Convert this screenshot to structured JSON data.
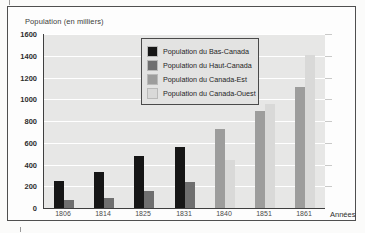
{
  "figure": {
    "title": "Population (en milliers)",
    "x_axis_title": "Années"
  },
  "colors": {
    "plot_background": "#e7e7e6",
    "gridline": "#ffffff",
    "figure_border": "#4f4f4f",
    "bas_canada": "#161616",
    "haut_canada": "#6f6f6f",
    "canada_est": "#9d9d9c",
    "canada_ouest": "#d9d9d8"
  },
  "chart_data": {
    "type": "bar",
    "title": "Population (en milliers)",
    "xlabel": "Années",
    "ylabel": "Population (en milliers)",
    "ylim": [
      0,
      1600
    ],
    "ytick_step": 200,
    "yticks": [
      0,
      200,
      400,
      600,
      800,
      1000,
      1200,
      1400,
      1600
    ],
    "grid": true,
    "legend_position": "top-center-inside",
    "categories": [
      "1806",
      "1814",
      "1825",
      "1831",
      "1840",
      "1851",
      "1861"
    ],
    "series": [
      {
        "name": "Population du Bas-Canada",
        "color": "#161616",
        "values": [
          250,
          335,
          480,
          560,
          null,
          null,
          null
        ]
      },
      {
        "name": "Population du Haut-Canada",
        "color": "#6f6f6f",
        "values": [
          75,
          95,
          160,
          240,
          null,
          null,
          null
        ]
      },
      {
        "name": "Population du Canada-Est",
        "color": "#9d9d9c",
        "values": [
          null,
          null,
          null,
          null,
          725,
          890,
          1110
        ]
      },
      {
        "name": "Population du Canada-Ouest",
        "color": "#d9d9d8",
        "values": [
          null,
          null,
          null,
          null,
          440,
          960,
          1410
        ]
      }
    ]
  }
}
